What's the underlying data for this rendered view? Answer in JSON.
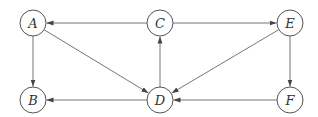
{
  "diagram": {
    "type": "directed-graph",
    "node_radius": 13,
    "colors": {
      "stroke": "#555555",
      "edge": "#666666",
      "label": "#333333",
      "background": "#ffffff"
    },
    "nodes": [
      {
        "id": "A",
        "label": "A",
        "x": 33,
        "y": 23
      },
      {
        "id": "C",
        "label": "C",
        "x": 160,
        "y": 23
      },
      {
        "id": "E",
        "label": "E",
        "x": 290,
        "y": 23
      },
      {
        "id": "B",
        "label": "B",
        "x": 33,
        "y": 100
      },
      {
        "id": "D",
        "label": "D",
        "x": 160,
        "y": 100
      },
      {
        "id": "F",
        "label": "F",
        "x": 290,
        "y": 100
      }
    ],
    "edges": [
      {
        "from": "C",
        "to": "A"
      },
      {
        "from": "C",
        "to": "E"
      },
      {
        "from": "A",
        "to": "B"
      },
      {
        "from": "A",
        "to": "D"
      },
      {
        "from": "D",
        "to": "C"
      },
      {
        "from": "E",
        "to": "D"
      },
      {
        "from": "E",
        "to": "F"
      },
      {
        "from": "D",
        "to": "B"
      },
      {
        "from": "F",
        "to": "D"
      }
    ]
  }
}
